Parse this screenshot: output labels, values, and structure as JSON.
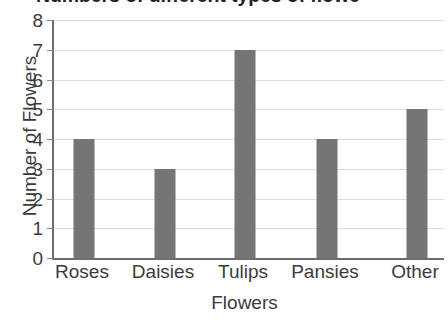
{
  "chart_data": {
    "type": "bar",
    "title": "Numbers of different types of flowe",
    "xlabel": "Flowers",
    "ylabel": "Number of Flowers",
    "categories": [
      "Roses",
      "Daisies",
      "Tulips",
      "Pansies",
      "Other"
    ],
    "values": [
      4,
      3,
      7,
      4,
      5
    ],
    "ylim": [
      0,
      8
    ],
    "ytick_labels": [
      "0",
      "1",
      "2",
      "3",
      "4",
      "5",
      "6",
      "7",
      "8"
    ],
    "ytick_values": [
      0,
      1,
      2,
      3,
      4,
      5,
      6,
      7,
      8
    ],
    "grid": true,
    "legend": false,
    "bar_color": "#757575",
    "axis_color": "#6d6d6d",
    "grid_color": "#dedede",
    "text_color": "#3b3b3b",
    "title_color": "#231f20",
    "background": "#ffffff"
  }
}
